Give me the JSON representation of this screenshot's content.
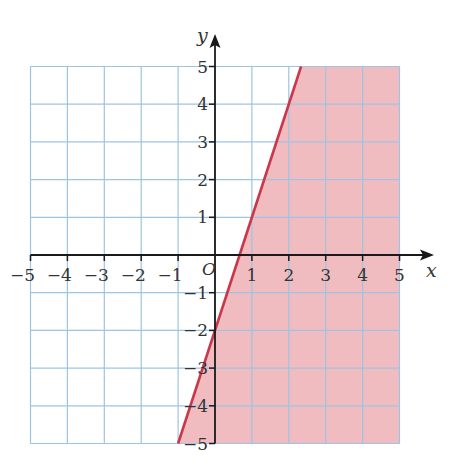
{
  "chart_data": {
    "type": "line",
    "title": "",
    "xlabel": "x",
    "ylabel": "y",
    "origin_label": "O",
    "xlim": [
      -5,
      5
    ],
    "ylim": [
      -5,
      5
    ],
    "grid": true,
    "x_ticks": [
      -5,
      -4,
      -3,
      -2,
      -1,
      1,
      2,
      3,
      4,
      5
    ],
    "y_ticks": [
      -5,
      -4,
      -3,
      -2,
      -1,
      1,
      2,
      3,
      4,
      5
    ],
    "x_tick_labels": [
      "−5",
      "−4",
      "−3",
      "−2",
      "−1",
      "1",
      "2",
      "3",
      "4",
      "5"
    ],
    "y_tick_labels": [
      "−5",
      "−4",
      "−3",
      "−2",
      "−1",
      "1",
      "2",
      "3",
      "4",
      "5"
    ],
    "boundary_line": {
      "equation": "y = 3x − 2",
      "slope": 3,
      "intercept": -2,
      "style": "solid",
      "points": [
        [
          -1,
          -5
        ],
        [
          0,
          -2
        ],
        [
          0.667,
          0
        ],
        [
          1,
          1
        ],
        [
          2,
          4
        ],
        [
          2.333,
          5
        ]
      ]
    },
    "shaded_region": {
      "inequality": "y ≤ 3x − 2",
      "side": "below-right of line",
      "polygon": [
        [
          -1,
          -5
        ],
        [
          2.333,
          5
        ],
        [
          5,
          5
        ],
        [
          5,
          -5
        ]
      ]
    },
    "colors": {
      "grid": "#9cc4e4",
      "axis": "#1a1a1a",
      "line": "#c8384a",
      "fill": "#f0bcc0"
    }
  }
}
